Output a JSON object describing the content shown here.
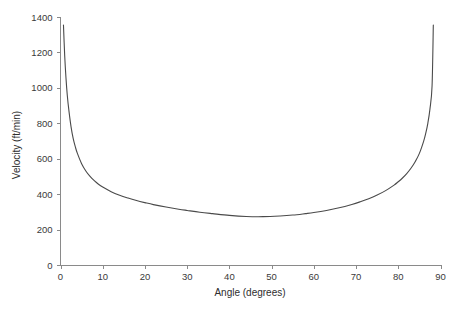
{
  "chart_data": {
    "type": "line",
    "title": "",
    "xlabel": "Angle (degrees)",
    "ylabel": "Velocity (ft/min)",
    "xlim": [
      0,
      90
    ],
    "ylim": [
      0,
      1400
    ],
    "xticks": [
      0,
      10,
      20,
      30,
      40,
      50,
      60,
      70,
      80,
      90
    ],
    "yticks": [
      0,
      200,
      400,
      600,
      800,
      1000,
      1200,
      1400
    ],
    "xtick_labels": [
      "0",
      "10",
      "20",
      "30",
      "40",
      "50",
      "60",
      "70",
      "80",
      "90"
    ],
    "ytick_labels": [
      "0",
      "200",
      "400",
      "600",
      "800",
      "1000",
      "1200",
      "1400"
    ],
    "grid": false,
    "legend": null,
    "legend_position": "none",
    "series": [
      {
        "name": "Velocity",
        "color": "#4a4a4a",
        "x": [
          0.7,
          1.0,
          1.3,
          1.6,
          2.0,
          2.5,
          3.0,
          3.5,
          4.0,
          5.0,
          6.0,
          7.0,
          8.0,
          9.0,
          10.0,
          12.0,
          14.0,
          16.0,
          18.0,
          20.0,
          22.0,
          25.0,
          28.0,
          30.0,
          33.0,
          36.0,
          40.0,
          44.0,
          48.0,
          52.0,
          55.0,
          58.0,
          60.0,
          63.0,
          66.0,
          69.0,
          71.0,
          73.0,
          75.0,
          77.0,
          79.0,
          80.0,
          81.0,
          82.0,
          83.0,
          84.0,
          85.0,
          86.0,
          86.5,
          87.0,
          87.5,
          88.0,
          88.3
        ],
        "y": [
          1355,
          1180,
          1055,
          960,
          870,
          780,
          715,
          668,
          630,
          572,
          531,
          500,
          476,
          456,
          440,
          414,
          394,
          378,
          364,
          352,
          341,
          327,
          315,
          308,
          298,
          290,
          280,
          274,
          273,
          277,
          282,
          290,
          296,
          308,
          323,
          342,
          357,
          374,
          395,
          420,
          451,
          470,
          491,
          516,
          546,
          583,
          630,
          698,
          743,
          800,
          880,
          1010,
          1355
        ]
      }
    ],
    "annotations": []
  },
  "figure": {
    "background_color": "#ffffff",
    "axis_color": "#8a8a8a",
    "text_color": "#3a3a3a",
    "curve_color": "#4a4a4a"
  }
}
